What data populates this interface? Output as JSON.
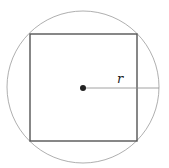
{
  "diagram": {
    "circle": {
      "cx": 83,
      "cy": 87,
      "r": 76,
      "stroke": "#9a9a9a",
      "stroke_width": 0.8
    },
    "square": {
      "x": 30,
      "y": 34,
      "width": 107,
      "height": 107,
      "stroke": "#555555",
      "stroke_width": 1.4
    },
    "center_point": {
      "cx": 83,
      "cy": 88,
      "r": 3,
      "fill": "#222222"
    },
    "radius_line": {
      "x1": 83,
      "y1": 88,
      "x2": 159,
      "y2": 88,
      "stroke": "#8a8a8a",
      "stroke_width": 0.8
    },
    "radius_label": {
      "text": "r",
      "x": 117,
      "y": 83
    }
  }
}
